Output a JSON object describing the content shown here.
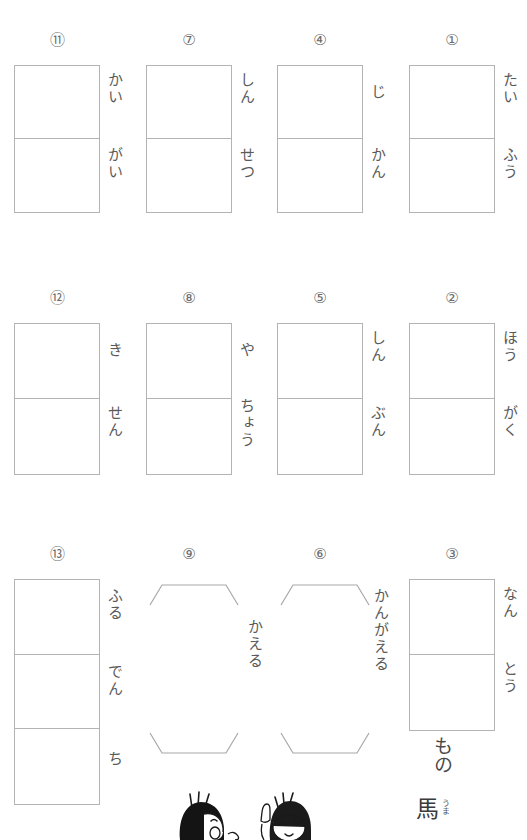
{
  "page": {
    "background_color": "#ffffff",
    "line_color": "#b3b3b3",
    "ink_color": "#5a5a5a"
  },
  "problems": [
    {
      "id": "p10",
      "number": "⑪",
      "cells": 2,
      "type": "grid",
      "reading_top": "かい",
      "reading_bottom": "がい",
      "reading_full": "かいがい",
      "tail": ""
    },
    {
      "id": "p7",
      "number": "⑦",
      "cells": 2,
      "type": "grid",
      "reading_top": "しん",
      "reading_bottom": "せつ",
      "reading_full": "しんせつ",
      "tail": ""
    },
    {
      "id": "p4",
      "number": "④",
      "cells": 2,
      "type": "grid",
      "reading_top": "じ",
      "reading_bottom": "かん",
      "reading_full": "じかん",
      "tail": ""
    },
    {
      "id": "p1",
      "number": "①",
      "cells": 2,
      "type": "grid",
      "reading_top": "たい",
      "reading_bottom": "ふう",
      "reading_full": "たいふう",
      "tail": ""
    },
    {
      "id": "p11",
      "number": "⑫",
      "cells": 2,
      "type": "grid",
      "reading_top": "き",
      "reading_bottom": "せん",
      "reading_full": "きせん",
      "tail": ""
    },
    {
      "id": "p8",
      "number": "⑧",
      "cells": 2,
      "type": "grid",
      "reading_top": "や",
      "reading_bottom": "ちょう",
      "reading_full": "やちょう",
      "tail": ""
    },
    {
      "id": "p5",
      "number": "⑤",
      "cells": 2,
      "type": "grid",
      "reading_top": "しん",
      "reading_bottom": "ぶん",
      "reading_full": "しんぶん",
      "tail": ""
    },
    {
      "id": "p2",
      "number": "②",
      "cells": 2,
      "type": "grid",
      "reading_top": "ほう",
      "reading_bottom": "がく",
      "reading_full": "ほうがく",
      "tail": ""
    },
    {
      "id": "p12",
      "number": "⑬",
      "cells": 3,
      "type": "grid",
      "reading_top": "ふる",
      "reading_mid": "でん",
      "reading_bottom": "ち",
      "reading_full": "ふるでんち",
      "tail": ""
    },
    {
      "id": "p9",
      "number": "⑨",
      "cells": 0,
      "type": "bracket",
      "reading_full": "かえる",
      "tail": ""
    },
    {
      "id": "p6",
      "number": "⑥",
      "cells": 0,
      "type": "bracket",
      "reading_full": "かんがえる",
      "tail": ""
    },
    {
      "id": "p3",
      "number": "③",
      "cells": 2,
      "type": "grid",
      "reading_top": "なん",
      "reading_bottom": "とう",
      "reading_full": "なんとう",
      "tail": "もの"
    }
  ],
  "footer_note": {
    "kanji": "馬",
    "furigana": "うま"
  },
  "illustration": {
    "name": "two-children-peeking",
    "description": "Two cartoon children with black hair at the bottom edge"
  }
}
